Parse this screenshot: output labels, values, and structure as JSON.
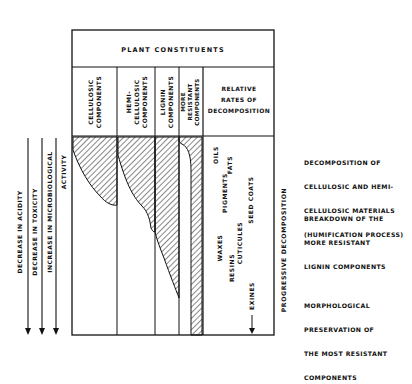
{
  "title": "PLANT CONSTITUENTS",
  "columns": [
    {
      "id": "cellulosic",
      "lines": [
        "CELLULOSIC",
        "COMPONENTS"
      ]
    },
    {
      "id": "hemicellulosic",
      "lines": [
        "HEMI-",
        "CELLULOSIC",
        "COMPONENTS"
      ]
    },
    {
      "id": "lignin",
      "lines": [
        "LIGNIN",
        "COMPONENTS"
      ]
    },
    {
      "id": "more-resistant",
      "lines": [
        "MORE",
        "RESISTANT",
        "COMPONENTS"
      ]
    }
  ],
  "rates_header": [
    "RELATIVE",
    "RATES OF",
    "DECOMPOSITION"
  ],
  "resistant_materials": [
    "OILS",
    "FATS",
    "PIGMENTS",
    "SEED COATS",
    "WAXES",
    "CUTICULES",
    "RESINS",
    "EXINES"
  ],
  "progressive_label": "PROGRESSIVE DECOMPOSITION",
  "left_arrows": [
    {
      "id": "acidity",
      "lines": [
        "DECREASE IN ACIDITY"
      ]
    },
    {
      "id": "toxicity",
      "lines": [
        "DECREASE IN TOXICITY"
      ]
    },
    {
      "id": "microbiological",
      "lines": [
        "INCREASE IN MICROBIOLOGICAL",
        "ACTIVITY"
      ]
    }
  ],
  "stages": [
    {
      "id": "humification",
      "lines": [
        "DECOMPOSITION OF",
        "CELLULOSIC AND HEMI-",
        "CELLULOSIC MATERIALS",
        "(HUMIFICATION PROCESS)"
      ]
    },
    {
      "id": "lignin-breakdown",
      "lines": [
        "BREAKDOWN OF THE",
        "MORE RESISTANT",
        "LIGNIN COMPONENTS"
      ]
    },
    {
      "id": "morphological",
      "lines": [
        "MORPHOLOGICAL",
        "PRESERVATION OF",
        "THE MOST RESISTANT",
        "COMPONENTS"
      ]
    }
  ]
}
